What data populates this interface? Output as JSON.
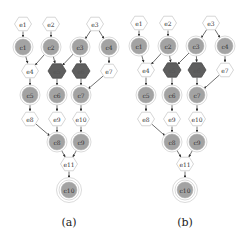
{
  "colors": {
    "background": "#ffffff",
    "event_fill": "#ffffff",
    "event_stroke": "#cccccc",
    "condition_fill": "#a3a3a3",
    "condition_ring": "#d0d0d0",
    "highlight_fill": "#5e5e5e",
    "highlight_stroke": "#4a4a4a",
    "edge": "#333333"
  },
  "panels": [
    {
      "caption": "(a)",
      "caption_pos": [
        69,
        222
      ],
      "nodes": [
        {
          "id": "e1",
          "label": "e1",
          "kind": "event",
          "x": 23,
          "y": 24
        },
        {
          "id": "e2",
          "label": "e2",
          "kind": "event",
          "x": 51,
          "y": 24
        },
        {
          "id": "e3",
          "label": "e3",
          "kind": "event",
          "x": 95,
          "y": 24
        },
        {
          "id": "c1",
          "label": "c1",
          "kind": "condition",
          "x": 23,
          "y": 47
        },
        {
          "id": "c2",
          "label": "c2",
          "kind": "condition",
          "x": 51,
          "y": 47
        },
        {
          "id": "c3",
          "label": "c3",
          "kind": "condition",
          "x": 80,
          "y": 47
        },
        {
          "id": "c4",
          "label": "c4",
          "kind": "condition",
          "x": 109,
          "y": 47
        },
        {
          "id": "e4",
          "label": "e4",
          "kind": "event",
          "x": 30,
          "y": 71
        },
        {
          "id": "e5",
          "label": "e5",
          "kind": "highlight",
          "x": 57,
          "y": 71
        },
        {
          "id": "e6",
          "label": "e6",
          "kind": "highlight",
          "x": 81,
          "y": 71
        },
        {
          "id": "e7",
          "label": "e7",
          "kind": "event",
          "x": 109,
          "y": 71
        },
        {
          "id": "c5",
          "label": "c5",
          "kind": "condition",
          "x": 30,
          "y": 95
        },
        {
          "id": "c6",
          "label": "c6",
          "kind": "condition",
          "x": 57,
          "y": 95
        },
        {
          "id": "c7",
          "label": "c7",
          "kind": "condition",
          "x": 81,
          "y": 95
        },
        {
          "id": "e8",
          "label": "e8",
          "kind": "event",
          "x": 30,
          "y": 119
        },
        {
          "id": "e9",
          "label": "e9",
          "kind": "event",
          "x": 57,
          "y": 119
        },
        {
          "id": "e10",
          "label": "e10",
          "kind": "event",
          "x": 81,
          "y": 119
        },
        {
          "id": "c8",
          "label": "c8",
          "kind": "condition",
          "x": 57,
          "y": 142
        },
        {
          "id": "c9",
          "label": "c9",
          "kind": "condition",
          "x": 81,
          "y": 142
        },
        {
          "id": "e11",
          "label": "e11",
          "kind": "event",
          "x": 69,
          "y": 164
        },
        {
          "id": "c10",
          "label": "c10",
          "kind": "final",
          "x": 69,
          "y": 190
        }
      ],
      "edges": [
        [
          "e1",
          "c1"
        ],
        [
          "e2",
          "c2"
        ],
        [
          "e3",
          "c3"
        ],
        [
          "e3",
          "c4"
        ],
        [
          "c1",
          "e4"
        ],
        [
          "c2",
          "e4"
        ],
        [
          "c2",
          "e5"
        ],
        [
          "c3",
          "e5"
        ],
        [
          "c3",
          "e6"
        ],
        [
          "c4",
          "e7"
        ],
        [
          "e4",
          "c5"
        ],
        [
          "e5",
          "c6"
        ],
        [
          "e6",
          "c7"
        ],
        [
          "e7",
          "c7"
        ],
        [
          "c5",
          "e8"
        ],
        [
          "c6",
          "e9"
        ],
        [
          "c7",
          "e10"
        ],
        [
          "e8",
          "c8"
        ],
        [
          "e9",
          "c8"
        ],
        [
          "e10",
          "c9"
        ],
        [
          "c8",
          "e11"
        ],
        [
          "c9",
          "e11"
        ],
        [
          "e11",
          "c10"
        ]
      ]
    },
    {
      "caption": "(b)",
      "caption_pos": [
        185,
        222
      ],
      "nodes": [
        {
          "id": "e1",
          "label": "e1",
          "kind": "event",
          "x": 139,
          "y": 23
        },
        {
          "id": "e2",
          "label": "e2",
          "kind": "event",
          "x": 168,
          "y": 23
        },
        {
          "id": "e3",
          "label": "e3",
          "kind": "event",
          "x": 211,
          "y": 23
        },
        {
          "id": "c1",
          "label": "c1",
          "kind": "condition",
          "x": 139,
          "y": 46
        },
        {
          "id": "c2",
          "label": "c2",
          "kind": "condition",
          "x": 168,
          "y": 46
        },
        {
          "id": "c3",
          "label": "c3",
          "kind": "condition",
          "x": 196,
          "y": 46
        },
        {
          "id": "c4",
          "label": "c4",
          "kind": "condition",
          "x": 225,
          "y": 46
        },
        {
          "id": "e4",
          "label": "e4",
          "kind": "event",
          "x": 146,
          "y": 70
        },
        {
          "id": "e5",
          "label": "e5",
          "kind": "highlight",
          "x": 172,
          "y": 70
        },
        {
          "id": "e6",
          "label": "e6",
          "kind": "highlight",
          "x": 197,
          "y": 70
        },
        {
          "id": "e7",
          "label": "e7",
          "kind": "event",
          "x": 225,
          "y": 70
        },
        {
          "id": "c5",
          "label": "c5",
          "kind": "condition",
          "x": 146,
          "y": 95
        },
        {
          "id": "c6",
          "label": "c6",
          "kind": "condition",
          "x": 172,
          "y": 95
        },
        {
          "id": "c7",
          "label": "c7",
          "kind": "condition",
          "x": 197,
          "y": 95
        },
        {
          "id": "e8",
          "label": "e8",
          "kind": "event",
          "x": 146,
          "y": 119
        },
        {
          "id": "e9",
          "label": "e9",
          "kind": "event",
          "x": 172,
          "y": 119
        },
        {
          "id": "e10",
          "label": "e10",
          "kind": "event",
          "x": 197,
          "y": 119
        },
        {
          "id": "c8",
          "label": "c8",
          "kind": "condition",
          "x": 172,
          "y": 142
        },
        {
          "id": "c9",
          "label": "c9",
          "kind": "condition",
          "x": 197,
          "y": 142
        },
        {
          "id": "e11",
          "label": "e11",
          "kind": "event",
          "x": 185,
          "y": 164
        },
        {
          "id": "c10",
          "label": "c10",
          "kind": "final",
          "x": 185,
          "y": 190
        }
      ],
      "edges": [
        [
          "e1",
          "c1"
        ],
        [
          "e2",
          "c2"
        ],
        [
          "e3",
          "c3"
        ],
        [
          "e3",
          "c4"
        ],
        [
          "c1",
          "e4"
        ],
        [
          "c2",
          "e4"
        ],
        [
          "c2",
          "e5"
        ],
        [
          "c3",
          "e5"
        ],
        [
          "c3",
          "e6"
        ],
        [
          "c4",
          "e7"
        ],
        [
          "e4",
          "c5"
        ],
        [
          "e5",
          "c6"
        ],
        [
          "e6",
          "c7"
        ],
        [
          "e7",
          "c7"
        ],
        [
          "c5",
          "e8"
        ],
        [
          "c6",
          "e9"
        ],
        [
          "c7",
          "e10"
        ],
        [
          "e8",
          "c8"
        ],
        [
          "e9",
          "c8"
        ],
        [
          "e10",
          "c9"
        ],
        [
          "c8",
          "e11"
        ],
        [
          "c9",
          "e11"
        ],
        [
          "e11",
          "c10"
        ]
      ]
    }
  ]
}
